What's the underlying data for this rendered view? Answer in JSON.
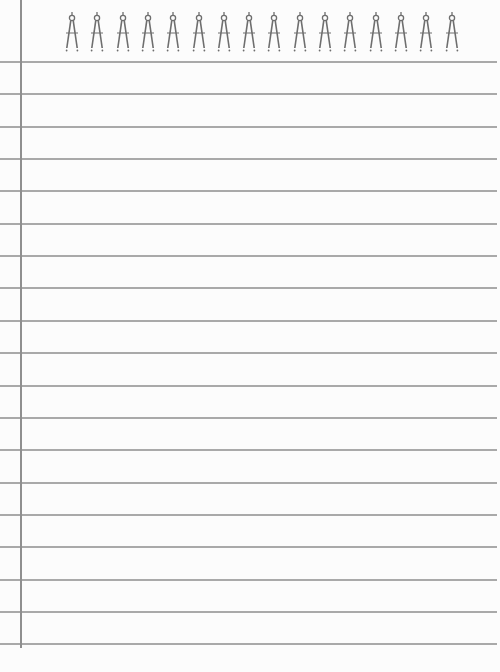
{
  "page": {
    "type": "ruled-notepad-paper",
    "background_color": "#fcfcfc",
    "rule_color": "#a9a9a9",
    "margin_color": "#8f8f8f"
  },
  "binding": {
    "icon": "drawing-compass-icon",
    "count": 16,
    "first_x": 65,
    "spacing": 25.3,
    "color": "#6e6e6e"
  },
  "rules": {
    "first_y": 61,
    "spacing": 32.35,
    "count": 19
  },
  "margin_line": {
    "x": 20,
    "bottom": 648
  }
}
